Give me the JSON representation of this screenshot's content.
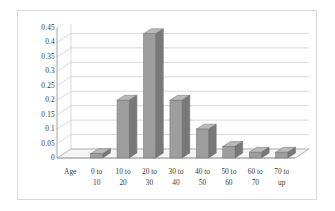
{
  "chart_data": {
    "type": "bar",
    "title": "",
    "subtitle": "",
    "xlabel": "Age",
    "ylabel": "",
    "categories": [
      "Age",
      "0 to 10",
      "10 to 20",
      "20 to 30",
      "30 to 40",
      "40 to 50",
      "50 to 60",
      "60 to 70",
      "70 to up"
    ],
    "category_lines": [
      [
        "Age",
        ""
      ],
      [
        "0 to",
        "10"
      ],
      [
        "10 to",
        "20"
      ],
      [
        "20 to",
        "30"
      ],
      [
        "30 to",
        "40"
      ],
      [
        "40 to",
        "50"
      ],
      [
        "50 to",
        "60"
      ],
      [
        "60 to",
        "70"
      ],
      [
        "70 to",
        "up"
      ]
    ],
    "values": [
      null,
      0.015,
      0.2,
      0.43,
      0.2,
      0.1,
      0.04,
      0.02,
      0.02
    ],
    "ylim": [
      0,
      0.45
    ],
    "ytick_labels": [
      "0",
      "0.05",
      "0.1",
      "0.15",
      "0.2",
      "0.25",
      "0.3",
      "0.35",
      "0.4",
      "0.45"
    ],
    "ytick_values": [
      0,
      0.05,
      0.1,
      0.15,
      0.2,
      0.25,
      0.3,
      0.35,
      0.4,
      0.45
    ],
    "grid": true,
    "legend": false,
    "legend_position": "none",
    "style": "3d-column",
    "annotations": []
  },
  "colors": {
    "bar_face": "#9d9d9d",
    "bar_side": "#787878",
    "bar_top": "#b9b9b9",
    "bar_outline": "#6f6f6f",
    "gridline": "#c9c9c9",
    "axis_line": "#9a9a9a",
    "floor": "#f4f4f4",
    "frame": "#d8d8d8",
    "text": "#3a3a3a",
    "background": "#ffffff"
  }
}
